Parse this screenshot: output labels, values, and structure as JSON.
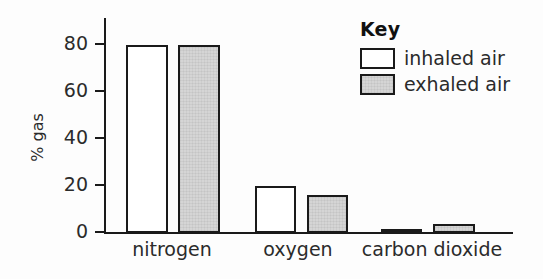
{
  "chart_data": {
    "type": "bar",
    "title": "",
    "xlabel": "",
    "ylabel": "% gas",
    "ylim": [
      0,
      90
    ],
    "yticks": [
      0,
      20,
      40,
      60,
      80
    ],
    "ytick_labels": [
      "0",
      "20",
      "40",
      "60",
      "80"
    ],
    "grid": false,
    "categories": [
      "nitrogen",
      "oxygen",
      "carbon dioxide"
    ],
    "series": [
      {
        "name": "inhaled air",
        "values": [
          80,
          20,
          0.5
        ],
        "color": "#ffffff"
      },
      {
        "name": "exhaled air",
        "values": [
          80,
          16,
          4
        ],
        "color": "#d5d5d5"
      }
    ],
    "legend": {
      "title": "Key",
      "position": "top-right",
      "entries": [
        {
          "label": "inhaled air",
          "swatch": "white-square"
        },
        {
          "label": "exhaled air",
          "swatch": "grey-square"
        }
      ]
    },
    "axis_color": "#1a1a1a",
    "text_color": "#2b2b2b",
    "background": "#fdfdfd"
  }
}
